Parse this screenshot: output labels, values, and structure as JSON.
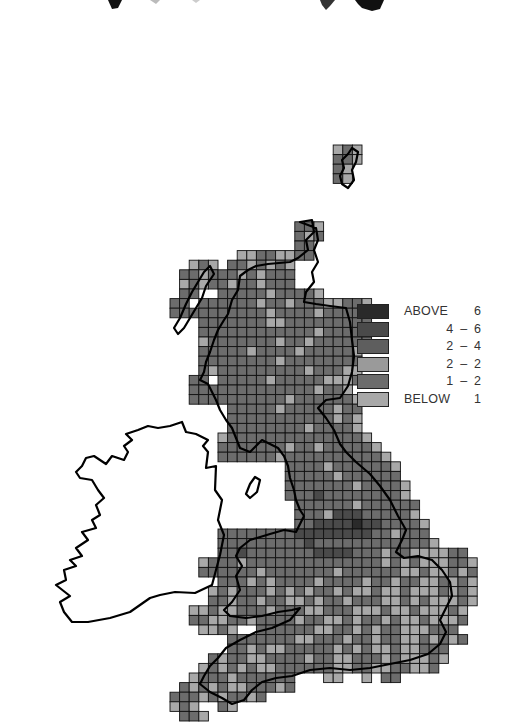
{
  "map": {
    "type": "grid-cell distribution map",
    "region": "Great Britain with Ireland outline",
    "cell_size_px": 9.6,
    "origin": {
      "x": 170,
      "y": 145
    },
    "colors": {
      "above_6": "#2a2a2a",
      "4_6": "#4a4a4a",
      "2_4": "#5e5e5e",
      "2_2": "#9a9a9a",
      "1_2": "#6c6c6c",
      "below_1": "#a8a8a8",
      "grid_line": "#111111",
      "coast": "#000000"
    },
    "rows": [
      {
        "r": 0,
        "c0": 17,
        "c1": 19,
        "pat": "bab"
      },
      {
        "r": 1,
        "c0": 17,
        "c1": 19,
        "pat": "aab"
      },
      {
        "r": 2,
        "c0": 17,
        "c1": 18,
        "pat": "ab"
      },
      {
        "r": 3,
        "c0": 17,
        "c1": 18,
        "pat": "ab"
      },
      {
        "r": 8,
        "c0": 13,
        "c1": 15,
        "pat": "aab"
      },
      {
        "r": 9,
        "c0": 13,
        "c1": 15,
        "pat": "aba"
      },
      {
        "r": 10,
        "c0": 13,
        "c1": 14,
        "pat": "aa"
      },
      {
        "r": 11,
        "c0": 7,
        "c1": 14,
        "pat": "bbaabbaa"
      },
      {
        "r": 12,
        "c0": 2,
        "c1": 13,
        "pat": "bab aababab aa"
      },
      {
        "r": 13,
        "c0": 1,
        "c1": 12,
        "pat": "aabaaababaaa"
      },
      {
        "r": 14,
        "c0": 1,
        "c1": 12,
        "pat": "babaabaabaaa"
      },
      {
        "r": 15,
        "c0": 1,
        "c1": 15,
        "pat": "aaw aaaaabaaaab"
      },
      {
        "r": 16,
        "c0": 0,
        "c1": 20,
        "pat": "aawaaaaaabaabaaabbaab"
      },
      {
        "r": 17,
        "c0": 0,
        "c1": 20,
        "pat": "aaaaaaaaaabaaaabaaaab"
      },
      {
        "r": 18,
        "c0": 3,
        "c1": 20,
        "pat": "aaaaaaabbaaaaaaaaa"
      },
      {
        "r": 19,
        "c0": 3,
        "c1": 20,
        "pat": "aaaaaaaaaaaabaaaaa"
      },
      {
        "r": 20,
        "c0": 3,
        "c1": 20,
        "pat": "baaaaaaabaabaaaaaa"
      },
      {
        "r": 21,
        "c0": 3,
        "c1": 19,
        "pat": "aaaaabaaaabaaaaab"
      },
      {
        "r": 22,
        "c0": 3,
        "c1": 19,
        "pat": "aaaaaaaabaaaaaaaa"
      },
      {
        "r": 23,
        "c0": 3,
        "c1": 19,
        "pat": "abaaaaaaaaabaaabb"
      },
      {
        "r": 24,
        "c0": 2,
        "c1": 19,
        "pat": "aawaaaaabaaaaabbba"
      },
      {
        "r": 25,
        "c0": 2,
        "c1": 18,
        "pat": "aaaaaaaaaaaaabaab"
      },
      {
        "r": 26,
        "c0": 2,
        "c1": 19,
        "pat": "aaaaaaaaaabaaaaaab"
      },
      {
        "r": 27,
        "c0": 6,
        "c1": 19,
        "pat": "aaaaabaaaaabaa"
      },
      {
        "r": 28,
        "c0": 6,
        "c1": 19,
        "pat": "aaaaaaaaaaabab"
      },
      {
        "r": 29,
        "c0": 6,
        "c1": 19,
        "pat": "aaaaaaaabaaaab"
      },
      {
        "r": 30,
        "c0": 5,
        "c1": 20,
        "pat": "baaaaaaaaaaaaaab"
      },
      {
        "r": 31,
        "c0": 5,
        "c1": 21,
        "pat": "aaaaaaabaabaaaaab"
      },
      {
        "r": 32,
        "c0": 5,
        "c1": 22,
        "pat": "aaaaaabaaaaaaaaaab"
      },
      {
        "r": 33,
        "c0": 12,
        "c1": 23,
        "pat": "aaaabaaaaaab"
      },
      {
        "r": 34,
        "c0": 12,
        "c1": 23,
        "pat": "aaaaabaaaaaa"
      },
      {
        "r": 35,
        "c0": 12,
        "c1": 24,
        "pat": "aaaaaaabaaaab"
      },
      {
        "r": 36,
        "c0": 12,
        "c1": 24,
        "pat": "aaadaaaaaaaab"
      },
      {
        "r": 37,
        "c0": 13,
        "c1": 25,
        "pat": "aaaaaabaaaaaa"
      },
      {
        "r": 38,
        "c0": 13,
        "c1": 25,
        "pat": "aaabdddaaaaab"
      },
      {
        "r": 39,
        "c0": 13,
        "c1": 26,
        "pat": "aaddddeddaaaab"
      },
      {
        "r": 40,
        "c0": 5,
        "c1": 26,
        "pat": "aaaaaaaaddddddddaabaaa"
      },
      {
        "r": 41,
        "c0": 5,
        "c1": 27,
        "pat": "aaaaaaaaadaaaaaaaaaaaab"
      },
      {
        "r": 42,
        "c0": 5,
        "c1": 30,
        "pat": "aadaaaaaaaddddaaabaabbbba"
      },
      {
        "r": 43,
        "c0": 3,
        "c1": 31,
        "pat": "baaabaaaaaaaaaaaaaabababbbaab"
      },
      {
        "r": 44,
        "c0": 3,
        "c1": 31,
        "pat": "aaaaaabaaaaaaabaaaaaabbabbaba"
      },
      {
        "r": 45,
        "c0": 5,
        "c1": 31,
        "pat": "aaababaaaabaaaabaabaabbabab"
      },
      {
        "r": 46,
        "c0": 4,
        "c1": 31,
        "pat": "babaaabababaababbabbabbbabab"
      },
      {
        "r": 47,
        "c0": 4,
        "c1": 31,
        "pat": "aabaabaabbabaabaaabbababbbab"
      },
      {
        "r": 48,
        "c0": 2,
        "c1": 30,
        "pat": "bbabbaaabaaabbaaabbbabbabbbab"
      },
      {
        "r": 49,
        "c0": 2,
        "c1": 30,
        "pat": "aabbaabaaaabaabbabaababbabbba"
      },
      {
        "r": 50,
        "c0": 3,
        "c1": 29,
        "pat": "bbab  aaaaaabbaababaabbbaa"
      },
      {
        "r": 51,
        "c0": 6,
        "c1": 30,
        "pat": "aaaaaaabbaaabaabaabbabab"
      },
      {
        "r": 52,
        "c0": 6,
        "c1": 28,
        "pat": "aababbaaaaabababbabbaaa"
      },
      {
        "r": 53,
        "c0": 4,
        "c1": 28,
        "pat": "abaabbaaaabaabbaaababbbab"
      },
      {
        "r": 54,
        "c0": 3,
        "c1": 27,
        "pat": "babababbaaaaaabbaabbaabba"
      },
      {
        "r": 55,
        "c0": 2,
        "c1": 23,
        "pat": "baaabaaaaaa   bb  b a"
      },
      {
        "r": 56,
        "c0": 1,
        "c1": 12,
        "pat": "abababbaaab"
      },
      {
        "r": 57,
        "c0": 0,
        "c1": 9,
        "pat": "aaababaab"
      },
      {
        "r": 58,
        "c0": 0,
        "c1": 6,
        "pat": "bab  ab"
      },
      {
        "r": 59,
        "c0": 1,
        "c1": 3,
        "pat": "aab"
      }
    ],
    "legend": {
      "items": [
        {
          "key": "above_6",
          "label": "ABOVE",
          "value": "6"
        },
        {
          "key": "4_6",
          "label": "",
          "value": "4  –  6"
        },
        {
          "key": "2_4",
          "label": "",
          "value": "2  –  4"
        },
        {
          "key": "2_2",
          "label": "",
          "value": "2  –  2"
        },
        {
          "key": "1_2",
          "label": "",
          "value": "1  –  2"
        },
        {
          "key": "below_1",
          "label": "BELOW",
          "value": "1"
        }
      ]
    }
  }
}
